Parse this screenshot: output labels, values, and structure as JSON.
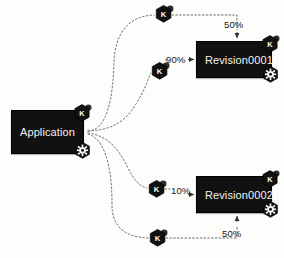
{
  "diagram": {
    "background_color": "#fdfdfc",
    "node_fill_color": "#111111",
    "node_text_color": "#f2f2f2",
    "edge_color": "#5a5a5a",
    "label_color": "#161616"
  },
  "nodes": [
    {
      "id": "application",
      "label": "Application",
      "badges": [
        "k-icon",
        "gear-icon"
      ]
    },
    {
      "id": "revision0001",
      "label": "Revision0001",
      "badges": [
        "k-icon",
        "gear-icon"
      ]
    },
    {
      "id": "revision0002",
      "label": "Revision0002",
      "badges": [
        "k-icon",
        "gear-icon"
      ]
    }
  ],
  "pods": [
    {
      "id": "pod-top",
      "label": "K"
    },
    {
      "id": "pod-middle",
      "label": "K"
    },
    {
      "id": "pod-lower",
      "label": "K"
    },
    {
      "id": "pod-bottom",
      "label": "K"
    }
  ],
  "labels": {
    "pct_90": "90%",
    "pct_10": "10%",
    "pct_50_top": "50%",
    "pct_50_bottom": "50%"
  }
}
